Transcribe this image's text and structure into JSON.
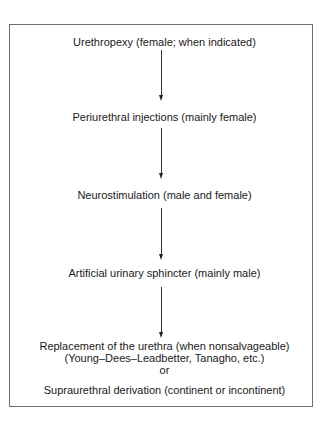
{
  "diagram": {
    "type": "flowchart",
    "direction": "top-to-bottom",
    "steps": [
      {
        "label": "Urethropexy (female; when indicated)"
      },
      {
        "label": "Periurethral injections (mainly female)"
      },
      {
        "label": "Neurostimulation (male and female)"
      },
      {
        "label": "Artificial urinary sphincter (mainly male)"
      },
      {
        "lines": [
          "Replacement of the urethra (when nonsalvageable)",
          "(Young–Dees–Leadbetter, Tanagho, etc.)",
          "or",
          "Supraurethral derivation (continent or incontinent)"
        ]
      }
    ],
    "arrows": [
      {
        "from": 0,
        "to": 1
      },
      {
        "from": 1,
        "to": 2
      },
      {
        "from": 2,
        "to": 3
      },
      {
        "from": 3,
        "to": 4
      }
    ]
  }
}
